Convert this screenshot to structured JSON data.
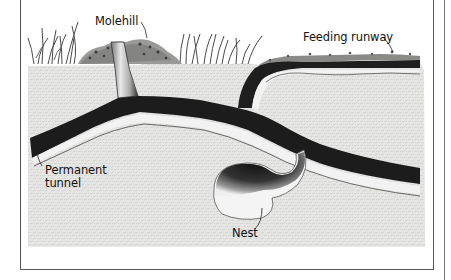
{
  "diagram": {
    "type": "cross-section illustration",
    "labels": {
      "molehill": "Molehill",
      "feeding_runway": "Feeding runway",
      "permanent_tunnel_line1": "Permanent",
      "permanent_tunnel_line2": "tunnel",
      "nest": "Nest"
    },
    "colors": {
      "soil": "#e4e4e2",
      "soil_texture": "#c8c8c6",
      "tunnel_dark": "#1e1e1e",
      "tunnel_light": "#f4f4f4",
      "grass": "#555555",
      "frame": "#555555",
      "text": "#111111"
    }
  }
}
